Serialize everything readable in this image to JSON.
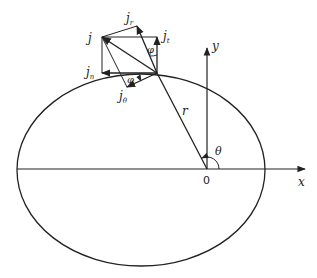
{
  "diagram": {
    "axes": {
      "x_label": "x",
      "y_label": "y",
      "origin_label": "0"
    },
    "labels": {
      "radius": "r",
      "theta": "θ",
      "phi_top": "φ",
      "phi_bottom": "φ",
      "j": "j",
      "j_r": "r",
      "j_t": "t",
      "j_n": "n",
      "j_theta": "θ"
    },
    "vectors": [
      {
        "name": "j",
        "label": "j"
      },
      {
        "name": "j_r",
        "label": "j_r"
      },
      {
        "name": "j_t",
        "label": "j_t"
      },
      {
        "name": "j_n",
        "label": "j_n"
      },
      {
        "name": "j_theta",
        "label": "j_θ"
      }
    ],
    "colors": {
      "stroke": "#222222",
      "background": "#ffffff"
    }
  }
}
